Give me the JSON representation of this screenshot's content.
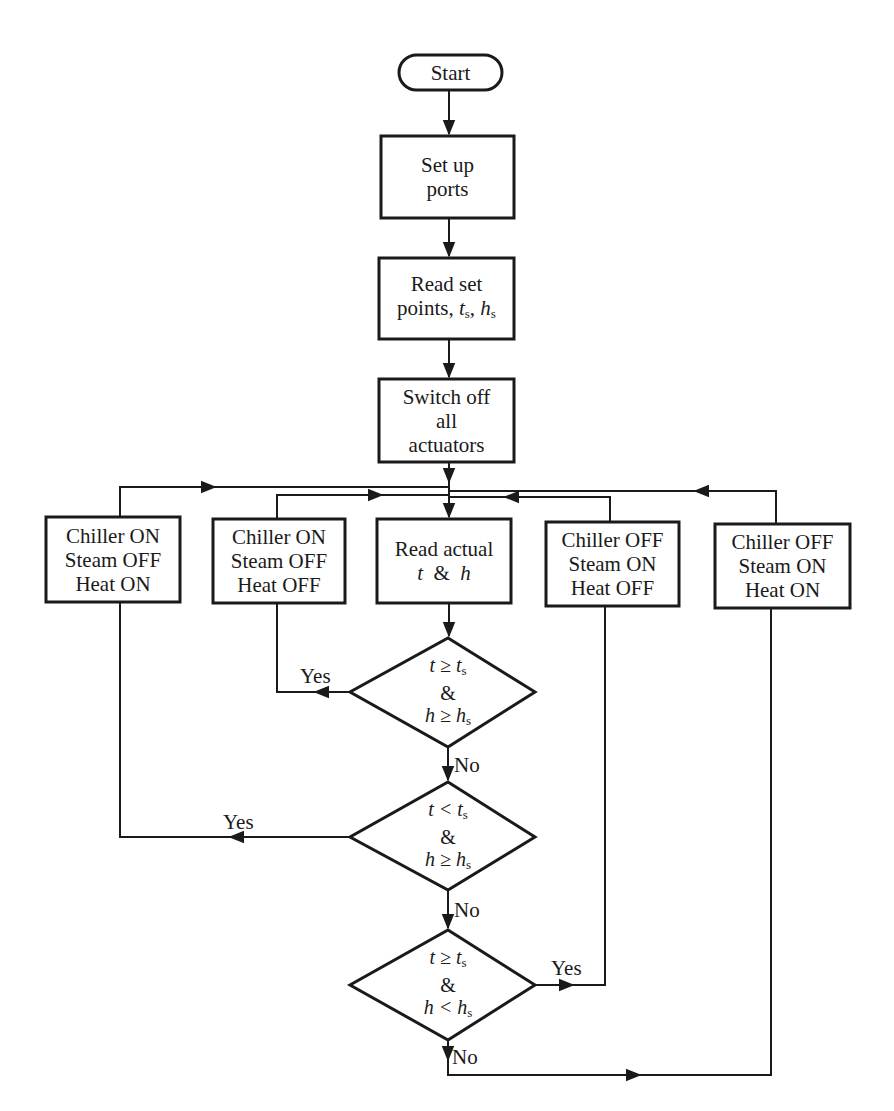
{
  "flowchart": {
    "start": {
      "label": "Start"
    },
    "setup": {
      "lines": [
        "Set up",
        "ports"
      ]
    },
    "read_setpoints": {
      "lines": [
        "Read set",
        "points, t",
        "s",
        ", h",
        "s"
      ]
    },
    "switch_off": {
      "lines": [
        "Switch off",
        "all",
        "actuators"
      ]
    },
    "read_actual": {
      "lines": [
        "Read actual",
        "t  &  h"
      ]
    },
    "action_boxes": [
      {
        "lines": [
          "Chiller ON",
          "Steam OFF",
          "Heat ON"
        ]
      },
      {
        "lines": [
          "Chiller ON",
          "Steam OFF",
          "Heat OFF"
        ]
      },
      {
        "lines": [
          "Chiller OFF",
          "Steam ON",
          "Heat OFF"
        ]
      },
      {
        "lines": [
          "Chiller OFF",
          "Steam ON",
          "Heat ON"
        ]
      }
    ],
    "decisions": [
      {
        "line1": "t ≥ t",
        "line1_sub": "s",
        "amp": "&",
        "line3": "h ≥ h",
        "line3_sub": "s",
        "yes": "Yes",
        "no": "No"
      },
      {
        "line1": "t < t",
        "line1_sub": "s",
        "amp": "&",
        "line3": "h ≥ h",
        "line3_sub": "s",
        "yes": "Yes",
        "no": "No"
      },
      {
        "line1": "t ≥ t",
        "line1_sub": "s",
        "amp": "&",
        "line3": "h < h",
        "line3_sub": "s",
        "yes": "Yes",
        "no": "No"
      }
    ]
  }
}
